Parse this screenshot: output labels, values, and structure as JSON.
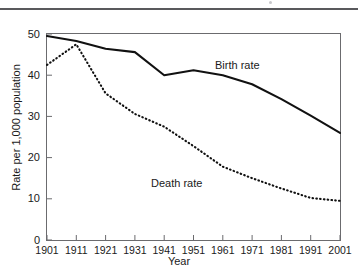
{
  "page": {
    "background_color": "#ffffff",
    "rule_color": "#59595c"
  },
  "chart_data": {
    "type": "line",
    "title": "",
    "subtitle": "",
    "xlabel": "Year",
    "ylabel": "Rate per 1,000 population",
    "xlim": [
      1901,
      2001
    ],
    "ylim": [
      0,
      50
    ],
    "grid": false,
    "legend_position": "inline-annotation",
    "x": [
      1901,
      1911,
      1921,
      1931,
      1941,
      1951,
      1961,
      1971,
      1981,
      1991,
      2001
    ],
    "xticks": [
      "1901",
      "1911",
      "1921",
      "1931",
      "1941",
      "1951",
      "1961",
      "1971",
      "1981",
      "1991",
      "2001"
    ],
    "yticks": [
      "0",
      "10",
      "20",
      "30",
      "40",
      "50"
    ],
    "ytick_values": [
      0,
      10,
      20,
      30,
      40,
      50
    ],
    "series": [
      {
        "name": "Birth rate",
        "style": "solid",
        "color": "#111111",
        "width": 2.1,
        "values": [
          49.5,
          48.3,
          46.4,
          45.6,
          40.0,
          41.2,
          40.0,
          37.8,
          34.2,
          30.2,
          26.0
        ]
      },
      {
        "name": "Death rate",
        "style": "dotted",
        "color": "#111111",
        "width": 2.1,
        "values": [
          42.5,
          47.5,
          35.6,
          30.6,
          27.5,
          22.8,
          17.8,
          15.0,
          12.5,
          10.2,
          9.5
        ]
      }
    ],
    "annotations": [
      {
        "text": "Birth rate",
        "x": 1958,
        "y": 44.5
      },
      {
        "text": "Death rate",
        "x": 1941,
        "y": 16.2
      }
    ]
  },
  "axis": {
    "y_title": "Rate per 1,000 population",
    "x_title": "Year"
  }
}
